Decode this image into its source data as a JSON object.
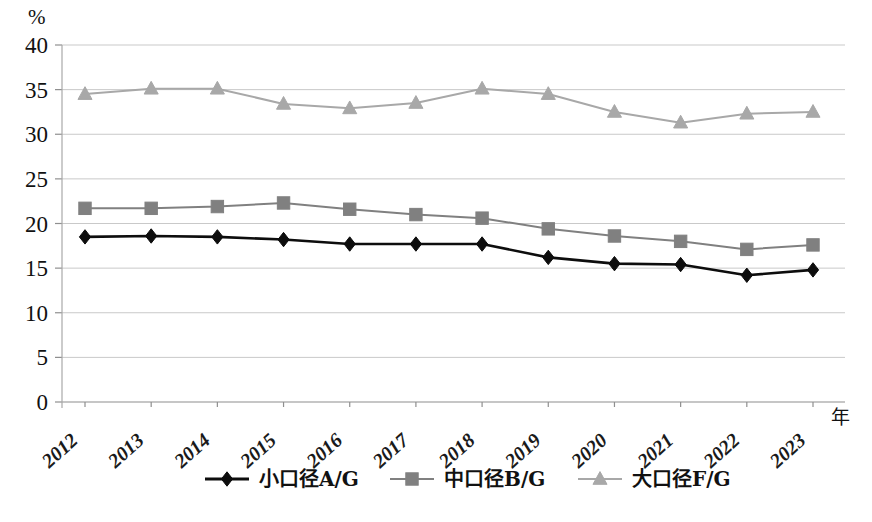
{
  "chart_data": {
    "type": "line",
    "title": "",
    "subtitle": "",
    "xlabel": "年",
    "ylabel": "%",
    "ylim": [
      0,
      40
    ],
    "yticks": [
      0,
      5,
      10,
      15,
      20,
      25,
      30,
      35,
      40
    ],
    "grid": true,
    "legend_position": "bottom",
    "categories": [
      "2012",
      "2013",
      "2014",
      "2015",
      "2016",
      "2017",
      "2018",
      "2019",
      "2020",
      "2021",
      "2022",
      "2023"
    ],
    "series": [
      {
        "name": "小口径A/G",
        "marker": "diamond",
        "color": "#0d0d0d",
        "values": [
          18.5,
          18.6,
          18.5,
          18.2,
          17.7,
          17.7,
          17.7,
          16.2,
          15.5,
          15.4,
          14.2,
          14.8
        ]
      },
      {
        "name": "中口径B/G",
        "marker": "square",
        "color": "#808080",
        "values": [
          21.7,
          21.7,
          21.9,
          22.3,
          21.6,
          21.0,
          20.6,
          19.4,
          18.6,
          18.0,
          17.1,
          17.6
        ]
      },
      {
        "name": "大口径F/G",
        "marker": "triangle",
        "color": "#a8a8a8",
        "values": [
          34.5,
          35.1,
          35.1,
          33.4,
          32.9,
          33.5,
          35.1,
          34.5,
          32.5,
          31.3,
          32.3,
          32.5
        ]
      }
    ],
    "annotations": []
  },
  "axes": {
    "y_unit": "%",
    "x_axis_name": "年",
    "y_tick_labels": [
      "40",
      "35",
      "30",
      "25",
      "20",
      "15",
      "10",
      "5",
      "0"
    ],
    "x_tick_labels": [
      "2012",
      "2013",
      "2014",
      "2015",
      "2016",
      "2017",
      "2018",
      "2019",
      "2020",
      "2021",
      "2022",
      "2023"
    ]
  },
  "legend": {
    "entries": [
      {
        "label": "小口径A/G",
        "marker": "diamond",
        "color": "#0d0d0d"
      },
      {
        "label": "中口径B/G",
        "marker": "square",
        "color": "#808080"
      },
      {
        "label": "大口径F/G",
        "marker": "triangle",
        "color": "#a8a8a8"
      }
    ]
  },
  "caption": {
    "text": ""
  }
}
